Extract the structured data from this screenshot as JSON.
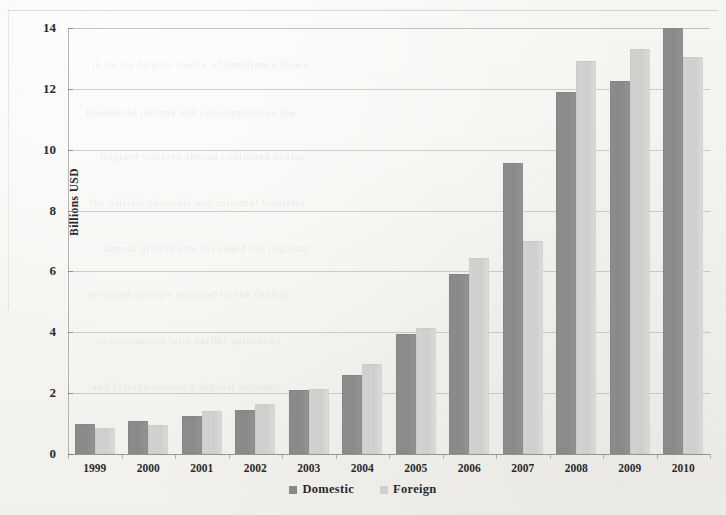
{
  "chart_data": {
    "type": "bar",
    "title": "",
    "subtitle": "",
    "xlabel": "",
    "ylabel": "Billions USD",
    "categories": [
      "1999",
      "2000",
      "2001",
      "2002",
      "2003",
      "2004",
      "2005",
      "2006",
      "2007",
      "2008",
      "2009",
      "2010"
    ],
    "series": [
      {
        "name": "Domestic",
        "color": "#8a8a8a",
        "values": [
          1.0,
          1.1,
          1.25,
          1.45,
          2.1,
          2.6,
          3.95,
          5.9,
          9.55,
          11.9,
          12.25,
          14.0
        ]
      },
      {
        "name": "Foreign",
        "color": "#d0d0ce",
        "values": [
          0.85,
          0.95,
          1.4,
          1.65,
          2.15,
          2.95,
          4.15,
          6.45,
          7.0,
          12.9,
          13.3,
          13.05
        ]
      }
    ],
    "ylim": [
      0,
      14
    ],
    "yticks": [
      0,
      2,
      4,
      6,
      8,
      10,
      12,
      14
    ],
    "ytick_labels": [
      "0",
      "2",
      "4",
      "6",
      "8",
      "10",
      "12",
      "14"
    ],
    "grid": true,
    "grid_axis": "y",
    "legend_position": "bottom",
    "bar_orientation": "vertical"
  },
  "axis": {
    "y_title": "Billions  USD"
  },
  "legend": {
    "items": [
      {
        "label": "Domestic",
        "swatch": "domestic-swatch-icon"
      },
      {
        "label": "Foreign",
        "swatch": "foreign-swatch-icon"
      }
    ]
  },
  "ghost_text": [
    "to be the largest source of remittance flows",
    "household income and consumption in the",
    "migrant workers abroad continued to rise",
    "the official channels and informal transfers",
    "annual growth rate exceeded the regional",
    "recorded inflows reported by the central",
    "in comparison with earlier periods of",
    "and foreign currency deposit accounts"
  ]
}
